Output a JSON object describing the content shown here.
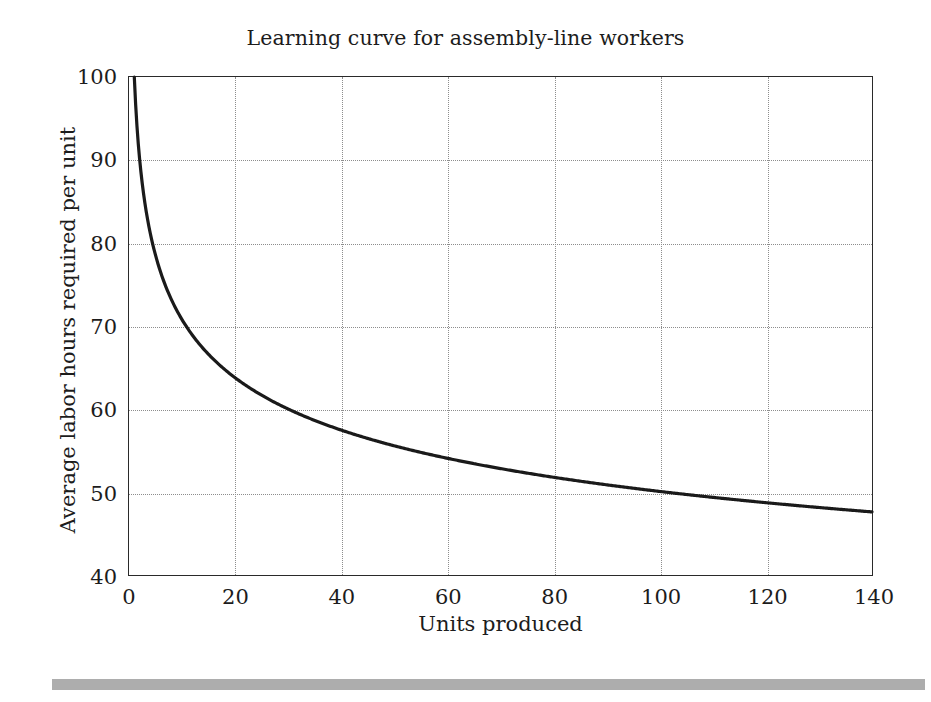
{
  "figure": {
    "background_color": "#ffffff",
    "rule_color": "#adadad"
  },
  "chart_data": {
    "type": "line",
    "title": "Learning curve for assembly-line workers",
    "xlabel": "Units produced",
    "ylabel": "Average labor hours required per unit",
    "xlim": [
      0,
      140
    ],
    "ylim": [
      40,
      100
    ],
    "xticks": [
      0,
      20,
      40,
      60,
      80,
      100,
      120,
      140
    ],
    "yticks": [
      40,
      50,
      60,
      70,
      80,
      90,
      100
    ],
    "grid": true,
    "grid_style": "dotted",
    "grid_color": "#8d8d8d",
    "legend": "none",
    "line_color": "#1a1a1a",
    "line_width": 3.2,
    "model": "y = 100 * n^(-0.1515)",
    "x": [
      1,
      2,
      3,
      4,
      5,
      6,
      7,
      8,
      10,
      12,
      14,
      16,
      18,
      20,
      25,
      30,
      35,
      40,
      45,
      50,
      55,
      60,
      65,
      70,
      75,
      80,
      85,
      90,
      95,
      100,
      105,
      110,
      115,
      120,
      125,
      130,
      135,
      140
    ],
    "y": [
      100.0,
      90.0,
      84.9,
      81.1,
      78.3,
      76.1,
      74.2,
      72.6,
      70.0,
      67.9,
      66.3,
      64.9,
      63.7,
      62.7,
      60.6,
      58.9,
      57.6,
      56.5,
      55.5,
      54.7,
      54.0,
      53.3,
      52.7,
      52.2,
      51.7,
      51.2,
      50.8,
      50.4,
      50.1,
      49.7,
      49.4,
      49.1,
      48.8,
      48.5,
      48.3,
      48.0,
      47.8,
      47.6
    ]
  }
}
